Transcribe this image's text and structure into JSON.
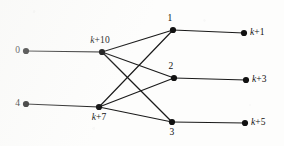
{
  "figure": {
    "type": "directed-layered-graph",
    "background_color": "#fdfdfc",
    "ink_color": "#111111",
    "width": 284,
    "height": 146
  },
  "nodes": [
    {
      "id": "n0",
      "label": "0",
      "x": 26,
      "y": 51,
      "label_pos": "left",
      "label_dx": -6,
      "label_dy": 0,
      "column": "source"
    },
    {
      "id": "n4",
      "label": "4",
      "x": 26,
      "y": 104,
      "label_pos": "left",
      "label_dx": -6,
      "label_dy": 0,
      "column": "source"
    },
    {
      "id": "nk10",
      "label": "k+10",
      "x": 102,
      "y": 52,
      "label_pos": "above",
      "label_dx": -2,
      "label_dy": -7,
      "column": "second"
    },
    {
      "id": "nk7",
      "label": "k+7",
      "x": 99,
      "y": 107,
      "label_pos": "below",
      "label_dx": 0,
      "label_dy": 6,
      "column": "second"
    },
    {
      "id": "n1",
      "label": "1",
      "x": 173,
      "y": 30,
      "label_pos": "above",
      "label_dx": -3,
      "label_dy": -7,
      "column": "third"
    },
    {
      "id": "n2",
      "label": "2",
      "x": 174,
      "y": 78,
      "label_pos": "above",
      "label_dx": -3,
      "label_dy": -7,
      "column": "third"
    },
    {
      "id": "n3",
      "label": "3",
      "x": 172,
      "y": 122,
      "label_pos": "below",
      "label_dx": 0,
      "label_dy": 6,
      "column": "third"
    },
    {
      "id": "nk1",
      "label": "k+1",
      "x": 244,
      "y": 33,
      "label_pos": "right",
      "label_dx": 6,
      "label_dy": 0,
      "column": "sink"
    },
    {
      "id": "nk3",
      "label": "k+3",
      "x": 246,
      "y": 80,
      "label_pos": "right",
      "label_dx": 6,
      "label_dy": 0,
      "column": "sink"
    },
    {
      "id": "nk5",
      "label": "k+5",
      "x": 245,
      "y": 123,
      "label_pos": "right",
      "label_dx": 6,
      "label_dy": 0,
      "column": "sink"
    }
  ],
  "edges": [
    {
      "from": "n0",
      "to": "nk10"
    },
    {
      "from": "n4",
      "to": "nk7"
    },
    {
      "from": "nk10",
      "to": "n1"
    },
    {
      "from": "nk10",
      "to": "n2"
    },
    {
      "from": "nk10",
      "to": "n3"
    },
    {
      "from": "nk7",
      "to": "n1"
    },
    {
      "from": "nk7",
      "to": "n2"
    },
    {
      "from": "nk7",
      "to": "n3"
    },
    {
      "from": "n1",
      "to": "nk1"
    },
    {
      "from": "n2",
      "to": "nk3"
    },
    {
      "from": "n3",
      "to": "nk5"
    }
  ],
  "style": {
    "node_radius": 3.1,
    "edge_width": 1.15,
    "label_font_size": 9.5
  }
}
